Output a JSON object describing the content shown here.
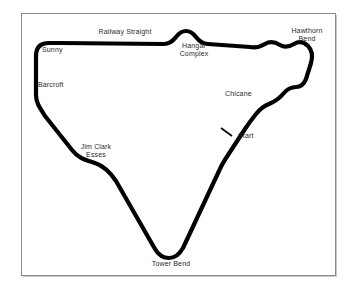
{
  "map": {
    "title": "Snetterton Circuit Layout Map",
    "type": "racing-circuit-diagram",
    "canvas": {
      "width": 357,
      "height": 292
    },
    "colors": {
      "background": "#ffffff",
      "track": "#000000",
      "label_text": "#2b2b2b",
      "frame_border": "#8a8a8a"
    },
    "frame": {
      "x": 21,
      "y": 13,
      "width": 315,
      "height": 263
    },
    "track": {
      "stroke_width": 4.2,
      "closed_loop": true,
      "path": "M 49 43 C 40 43 36 48 36 56 L 36 95 C 36 103 40 108 45 116 L 72 150 C 79 159 86 160 95 163 C 104 166 110 172 116 181 L 155 249 C 159 256 164 258 169 258 C 174 258 179 255 183 248 L 219 171 C 222 164 224 161 228 155 L 245 129 C 249 123 252 119 256 114 C 260 109 264 106 269 104 C 276 101 279 99 283 94 C 287 89 291 87 296 87 C 301 87 304 84 306 79 L 311 63 C 313 56 312 50 308 46 C 304 42 299 41 294 44 C 289 47 285 48 280 45 C 275 42 270 41 265 44 C 260 47 256 48 250 47 L 208 44 C 202 44 199 41 196 37 C 193 33 190 31 186 31 C 182 31 179 33 176 37 C 173 41 170 44 164 44 L 60 43 Z"
    },
    "start_marker": {
      "label": "Start",
      "tick": {
        "x1": 221,
        "y1": 128,
        "x2": 232,
        "y2": 136
      }
    },
    "labels": [
      {
        "id": "railway-straight",
        "text": "Railway Straight",
        "x": 89,
        "y": 28,
        "width": 72,
        "align": "center"
      },
      {
        "id": "hangar-complex",
        "text": "Hangar\nComplex",
        "x": 173,
        "y": 42,
        "width": 42,
        "align": "center"
      },
      {
        "id": "hawthorn-bend",
        "text": "Hawthorn\nBend",
        "x": 287,
        "y": 27,
        "width": 40,
        "align": "center"
      },
      {
        "id": "sunny",
        "text": "Sunny",
        "x": 42,
        "y": 46,
        "width": 30,
        "align": "left"
      },
      {
        "id": "barcroft",
        "text": "Barcroft",
        "x": 38,
        "y": 81,
        "width": 36,
        "align": "left"
      },
      {
        "id": "chicane",
        "text": "Chicane",
        "x": 225,
        "y": 90,
        "width": 32,
        "align": "left"
      },
      {
        "id": "start",
        "text": "Start",
        "x": 238,
        "y": 132,
        "width": 22,
        "align": "left"
      },
      {
        "id": "jim-clark-esses",
        "text": "Jim Clark\nEsses",
        "x": 76,
        "y": 143,
        "width": 40,
        "align": "center"
      },
      {
        "id": "tower-bend",
        "text": "Tower Bend",
        "x": 145,
        "y": 260,
        "width": 52,
        "align": "center"
      }
    ]
  }
}
